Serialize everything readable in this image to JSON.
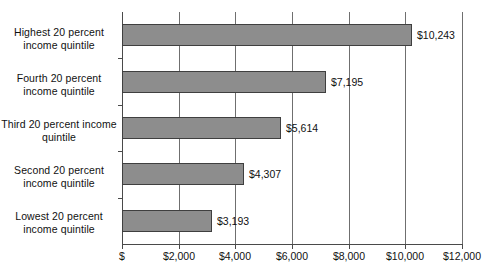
{
  "chart_data": {
    "type": "bar",
    "orientation": "horizontal",
    "title": "",
    "subtitle": "",
    "xlabel": "",
    "ylabel": "",
    "categories": [
      "Highest 20 percent income quintile",
      "Fourth 20 percent income quintile",
      "Third 20 percent income quintile",
      "Second 20 percent income quintile",
      "Lowest 20 percent income quintile"
    ],
    "values": [
      10243,
      7195,
      5614,
      4307,
      3193
    ],
    "value_labels": [
      "$10,243",
      "$7,195",
      "$5,614",
      "$4,307",
      "$3,193"
    ],
    "xlim": [
      0,
      12000
    ],
    "xticks": [
      0,
      2000,
      4000,
      6000,
      8000,
      10000,
      12000
    ],
    "xticklabels": [
      "$",
      "$2,000",
      "$4,000",
      "$6,000",
      "$8,000",
      "$10,000",
      "$12,000"
    ],
    "grid": true,
    "grid_axis": "x",
    "legend": false,
    "bar_color": "#8d8d8d",
    "bar_border_color": "#3f3f3f",
    "axis_color": "#4a4a4a",
    "gridline_color": "#6f6f6f",
    "background": "#ffffff"
  },
  "categories_display": [
    {
      "line1": "Highest 20 percent",
      "line2": "income quintile"
    },
    {
      "line1": "Fourth 20 percent",
      "line2": "income quintile"
    },
    {
      "line1": "Third 20 percent income",
      "line2": "quintile"
    },
    {
      "line1": "Second 20 percent",
      "line2": "income quintile"
    },
    {
      "line1": "Lowest 20 percent",
      "line2": "income quintile"
    }
  ]
}
